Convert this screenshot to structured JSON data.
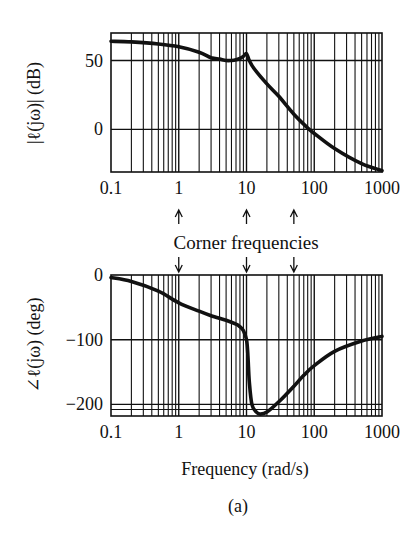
{
  "chart_data": [
    {
      "type": "line",
      "title": "",
      "xlabel": "",
      "ylabel": "|ℓ(jω)| (dB)",
      "xscale": "log",
      "xlim": [
        0.1,
        1000
      ],
      "ylim": [
        -31,
        70
      ],
      "x_ticks": [
        "0.1",
        "1",
        "10",
        "100",
        "1000"
      ],
      "y_ticks": [
        "50",
        "0"
      ],
      "y_tick_values": [
        50,
        0
      ],
      "grid": true,
      "series": [
        {
          "name": "magnitude",
          "x": [
            0.1,
            0.2,
            0.5,
            1,
            2,
            3,
            4,
            5,
            6,
            7,
            8,
            9,
            10,
            11,
            13,
            20,
            30,
            50,
            80,
            100,
            200,
            500,
            1000
          ],
          "values": [
            64,
            63.5,
            62,
            60,
            56,
            52,
            51,
            50,
            50,
            50.5,
            51.5,
            53,
            55,
            50,
            44,
            33,
            24,
            11,
            1,
            -3,
            -14,
            -25,
            -30
          ]
        }
      ]
    },
    {
      "type": "line",
      "title": "",
      "xlabel": "Frequency (rad/s)",
      "ylabel": "∠ℓ(jω) (deg)",
      "xscale": "log",
      "xlim": [
        0.1,
        1000
      ],
      "ylim": [
        -218,
        0
      ],
      "x_ticks": [
        "0.1",
        "1",
        "10",
        "100",
        "1000"
      ],
      "y_ticks": [
        "0",
        "−100",
        "−200"
      ],
      "y_tick_values": [
        0,
        -100,
        -200
      ],
      "grid": true,
      "series": [
        {
          "name": "phase",
          "x": [
            0.1,
            0.2,
            0.5,
            1,
            2,
            3,
            5,
            7,
            8,
            9,
            10,
            10.5,
            11,
            12,
            14,
            16,
            20,
            30,
            50,
            70,
            100,
            200,
            500,
            1000
          ],
          "values": [
            -4,
            -10,
            -25,
            -43,
            -56,
            -63,
            -70,
            -76,
            -80,
            -86,
            -100,
            -125,
            -165,
            -200,
            -212,
            -215,
            -212,
            -196,
            -172,
            -155,
            -140,
            -118,
            -102,
            -95
          ]
        }
      ]
    }
  ],
  "annotation": {
    "label": "Corner frequencies",
    "corner_frequencies": [
      1,
      10,
      50
    ]
  },
  "x_axis_label": "Frequency (rad/s)",
  "magnitude_ylabel": "|ℓ(jω)| (dB)",
  "phase_ylabel": "∠ℓ(jω) (deg)",
  "caption": "(a)"
}
